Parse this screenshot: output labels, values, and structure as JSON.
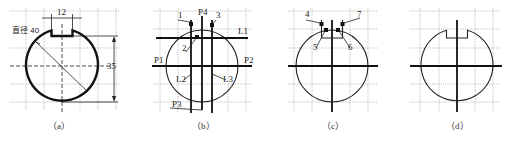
{
  "figure": {
    "panels": [
      {
        "id": "a",
        "caption": "（a）",
        "labels": {
          "diameter": "直径 40",
          "slot_width": "12",
          "height": "35"
        }
      },
      {
        "id": "b",
        "caption": "（b）",
        "labels": {
          "p1": "P1",
          "p2": "P2",
          "p3": "P3",
          "p4": "P4",
          "l1": "L1",
          "l2": "L2",
          "l3": "L3",
          "n1": "1",
          "n2": "2",
          "n3": "3"
        }
      },
      {
        "id": "c",
        "caption": "（c）",
        "labels": {
          "n4": "4",
          "n5": "5",
          "n6": "6",
          "n7": "7"
        }
      },
      {
        "id": "d",
        "caption": "（d）",
        "labels": {}
      }
    ]
  }
}
